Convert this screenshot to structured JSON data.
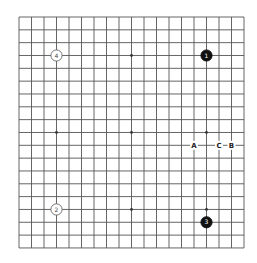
{
  "board": {
    "size": 19,
    "origin_x": 19,
    "origin_y": 17,
    "spacing_x": 12.5,
    "spacing_y": 12.83,
    "line_color": "#555555",
    "background": "#ffffff",
    "star_points": [
      [
        3,
        3
      ],
      [
        9,
        3
      ],
      [
        15,
        3
      ],
      [
        3,
        9
      ],
      [
        9,
        9
      ],
      [
        15,
        9
      ],
      [
        3,
        15
      ],
      [
        9,
        15
      ],
      [
        15,
        15
      ]
    ]
  },
  "stones": [
    {
      "label": "1",
      "color": "black",
      "col": 15,
      "row": 3
    },
    {
      "label": "2",
      "color": "white",
      "col": 3,
      "row": 15
    },
    {
      "label": "3",
      "color": "black",
      "col": 15,
      "row": 16
    },
    {
      "label": "4",
      "color": "white",
      "col": 3,
      "row": 3
    }
  ],
  "markers": [
    {
      "label": "A",
      "col": 14,
      "row": 10
    },
    {
      "label": "C",
      "col": 16,
      "row": 10
    },
    {
      "label": "B",
      "col": 17,
      "row": 10
    }
  ]
}
